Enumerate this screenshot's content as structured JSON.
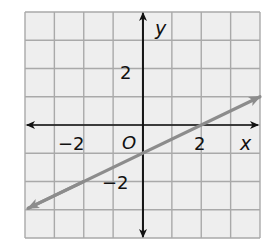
{
  "chart_data": {
    "type": "line",
    "title": "",
    "xlabel": "x",
    "ylabel": "y",
    "xlim": [
      -4,
      4
    ],
    "ylim": [
      -4,
      4
    ],
    "grid": true,
    "x_ticks_labeled": [
      -2,
      2
    ],
    "y_ticks_labeled": [
      2,
      -2
    ],
    "origin_label": "O",
    "series": [
      {
        "name": "line",
        "equation": "y = 0.5x - 1",
        "slope": 0.5,
        "y_intercept": -1,
        "x_intercept": 2,
        "x": [
          -3.9,
          -2,
          0,
          2,
          4
        ],
        "y": [
          -2.95,
          -2,
          -1,
          0,
          1
        ],
        "arrows_both_ends": true,
        "color": "#8c8c8c"
      }
    ]
  },
  "labels": {
    "x_axis": "x",
    "y_axis": "y",
    "origin": "O",
    "x_neg2": "−2",
    "x_pos2": "2",
    "y_pos2": "2",
    "y_neg2": "−2"
  },
  "colors": {
    "background": "#eeeeee",
    "grid": "#a9a9a9",
    "axis": "#111111",
    "line": "#8c8c8c"
  }
}
